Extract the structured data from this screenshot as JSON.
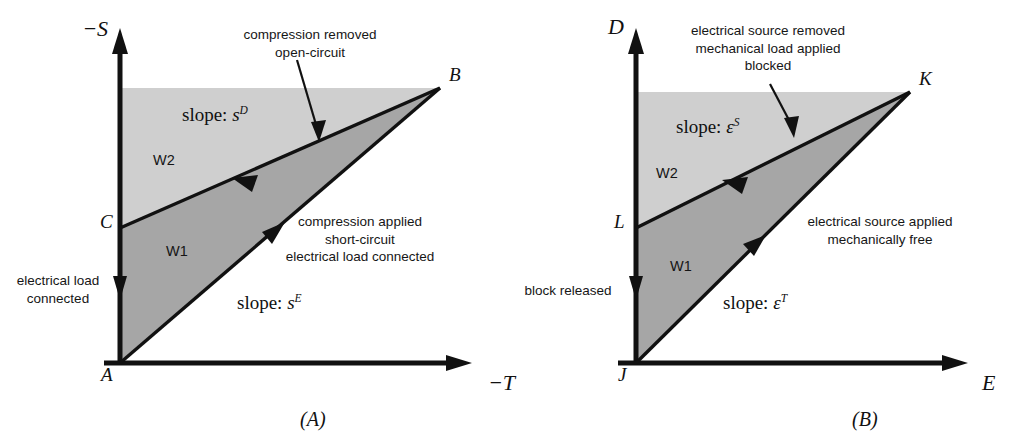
{
  "figure": {
    "type": "two-panel-diagram"
  },
  "panel_a": {
    "caption": "(A)",
    "y_axis_label": "−S",
    "x_axis_label": "−T",
    "vertices": [
      {
        "name": "A",
        "label": "A"
      },
      {
        "name": "B",
        "label": "B"
      },
      {
        "name": "C",
        "label": "C"
      }
    ],
    "regions": [
      {
        "name": "W1",
        "label": "W1",
        "fill": "#a6a6a6"
      },
      {
        "name": "W2",
        "label": "W2",
        "fill": "#cfcfcf"
      }
    ],
    "slope_upper": {
      "prefix": "slope:",
      "symbol": "s",
      "superscript": "D"
    },
    "slope_lower": {
      "prefix": "slope:",
      "symbol": "s",
      "superscript": "E"
    },
    "annotation_top": "compression removed\nopen-circuit",
    "annotation_top_line1": "compression removed",
    "annotation_top_line2": "open-circuit",
    "annotation_right_line1": "compression applied",
    "annotation_right_line2": "short-circuit",
    "annotation_right_line3": "electrical load connected",
    "annotation_left_line1": "electrical load",
    "annotation_left_line2": "connected"
  },
  "panel_b": {
    "caption": "(B)",
    "y_axis_label": "D",
    "x_axis_label": "E",
    "vertices": [
      {
        "name": "J",
        "label": "J"
      },
      {
        "name": "K",
        "label": "K"
      },
      {
        "name": "L",
        "label": "L"
      }
    ],
    "regions": [
      {
        "name": "W1",
        "label": "W1",
        "fill": "#a6a6a6"
      },
      {
        "name": "W2",
        "label": "W2",
        "fill": "#cfcfcf"
      }
    ],
    "slope_upper": {
      "prefix": "slope:",
      "symbol": "ε",
      "superscript": "S"
    },
    "slope_lower": {
      "prefix": "slope:",
      "symbol": "ε",
      "superscript": "T"
    },
    "annotation_top_line1": "electrical source removed",
    "annotation_top_line2": "mechanical load applied",
    "annotation_top_line3": "blocked",
    "annotation_right_line1": "electrical source applied",
    "annotation_right_line2": "mechanically free",
    "annotation_left_line1": "block released"
  },
  "colors": {
    "ink": "#1a1a1a",
    "shade_dark": "#a6a6a6",
    "shade_light": "#cfcfcf",
    "background": "#ffffff"
  }
}
